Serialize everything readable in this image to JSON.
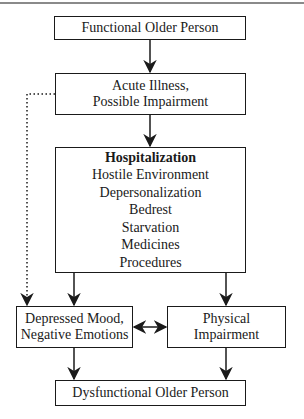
{
  "diagram": {
    "nodes": {
      "functional": {
        "label": "Functional Older Person"
      },
      "acute": {
        "lines": [
          "Acute Illness,",
          "Possible Impairment"
        ]
      },
      "hospitalization": {
        "title": "Hospitalization",
        "items": [
          "Hostile Environment",
          "Depersonalization",
          "Bedrest",
          "Starvation",
          "Medicines",
          "Procedures"
        ]
      },
      "depressed": {
        "lines": [
          "Depressed Mood,",
          "Negative Emotions"
        ]
      },
      "physical": {
        "lines": [
          "Physical",
          "Impairment"
        ]
      },
      "dysfunctional": {
        "label": "Dysfunctional Older Person"
      }
    },
    "edges": [
      {
        "from": "functional",
        "to": "acute",
        "style": "solid"
      },
      {
        "from": "acute",
        "to": "hospitalization",
        "style": "solid"
      },
      {
        "from": "acute",
        "to": "depressed",
        "style": "dotted"
      },
      {
        "from": "hospitalization",
        "to": "depressed",
        "style": "solid"
      },
      {
        "from": "hospitalization",
        "to": "physical",
        "style": "solid"
      },
      {
        "from": "depressed",
        "to": "physical",
        "style": "solid",
        "bidirectional": true
      },
      {
        "from": "depressed",
        "to": "dysfunctional",
        "style": "solid"
      },
      {
        "from": "physical",
        "to": "dysfunctional",
        "style": "solid"
      }
    ]
  }
}
